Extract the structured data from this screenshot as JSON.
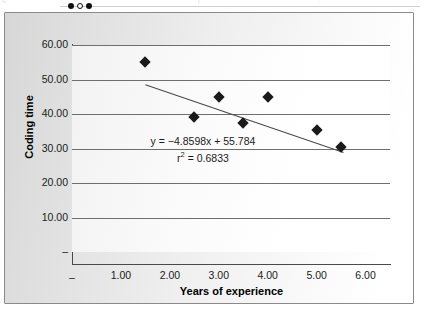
{
  "top_strip": {
    "left_ghost": "©",
    "mid_ghost": "|",
    "right_ghost": "·",
    "dots": [
      "filled",
      "hollow",
      "filled"
    ]
  },
  "chart_data": {
    "type": "scatter",
    "title": "",
    "xlabel": "Years of experience",
    "ylabel": "Coding time",
    "xlim": [
      0,
      6.5
    ],
    "ylim": [
      0,
      60
    ],
    "grid": true,
    "legend": "none",
    "xticks": [
      "–",
      "1.00",
      "2.00",
      "3.00",
      "4.00",
      "5.00",
      "6.00"
    ],
    "xtick_values": [
      0,
      1,
      2,
      3,
      4,
      5,
      6
    ],
    "yticks": [
      "–",
      "10.00",
      "20.00",
      "30.00",
      "40.00",
      "50.00",
      "60.00"
    ],
    "ytick_values": [
      0,
      10,
      20,
      30,
      40,
      50,
      60
    ],
    "points": [
      {
        "x": 1.5,
        "y": 55.0
      },
      {
        "x": 2.5,
        "y": 39.0
      },
      {
        "x": 3.0,
        "y": 45.0
      },
      {
        "x": 3.5,
        "y": 37.5
      },
      {
        "x": 4.0,
        "y": 45.0
      },
      {
        "x": 5.0,
        "y": 35.5
      },
      {
        "x": 5.5,
        "y": 30.5
      }
    ],
    "marker": "diamond",
    "marker_color": "#1a1a1a",
    "trendline": {
      "slope": -4.8598,
      "intercept": 55.784,
      "x_start": 1.5,
      "x_end": 5.55,
      "color": "#4a4a4a"
    },
    "annotation": {
      "equation": "y = −4.8598x + 55.784",
      "r_label": "r",
      "r_exponent": "2",
      "r_value": " = 0.6833"
    }
  },
  "colors": {
    "grid": "#6e6e6e",
    "axis": "#4a4a4a",
    "frame": "#8a8a8a",
    "text": "#1b1b1b",
    "marker": "#1a1a1a"
  }
}
